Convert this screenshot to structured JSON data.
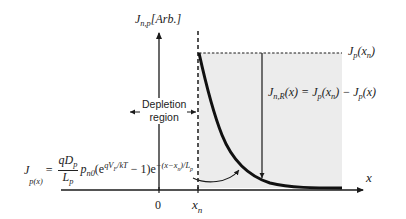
{
  "diagram": {
    "y_axis_label": "J",
    "y_axis_label_sub": "n,p",
    "y_axis_unit": "[Arb.]",
    "x_axis_label": "x",
    "x_ticks": [
      {
        "label": "0"
      },
      {
        "label_main": "x",
        "label_sub": "n"
      }
    ],
    "depletion_label_line1": "Depletion",
    "depletion_label_line2": "region",
    "jp_xn_label": "J",
    "jp_xn_sub": "p",
    "jp_xn_arg": "(x",
    "jp_xn_arg_sub": "n",
    "jp_xn_close": ")",
    "recomb_eq": {
      "lhs": "J",
      "lhs_sub": "n,R",
      "lhs_arg": "(x) = J",
      "t1_sub": "p",
      "t1_arg": "(x",
      "t1_arg_sub": "n",
      "t1_close": ") − J",
      "t2_sub": "p",
      "t2_arg": "(x)"
    },
    "diffusion_eq": {
      "lhs": "J",
      "lhs_sub": "p(x)",
      "equals": "=",
      "num": "qD",
      "num_sub": "p",
      "den": "L",
      "den_sub": "p",
      "p": "p",
      "p_sub": "n0",
      "paren_open": "(e",
      "exp1": "qV",
      "exp1_sub": "F",
      "exp1_rest": "/kT",
      "minus_one": " − 1)e",
      "exp2": "−(x−x",
      "exp2_sub": "n",
      "exp2_rest": ")/L",
      "exp2_sub2": "p"
    },
    "colors": {
      "shade": "#ececec",
      "line": "#1a1a1a",
      "curve": "#111111"
    }
  }
}
